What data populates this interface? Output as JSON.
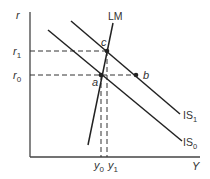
{
  "diagram": {
    "axes": {
      "y_label": "r",
      "x_label": "Y"
    },
    "y_ticks": [
      {
        "main": "r",
        "sub": "1"
      },
      {
        "main": "r",
        "sub": "0"
      }
    ],
    "x_ticks": [
      {
        "main": "y",
        "sub": "0"
      },
      {
        "main": "y",
        "sub": "1"
      }
    ],
    "curves": {
      "lm": {
        "label": "LM"
      },
      "is1": {
        "main": "IS",
        "sub": "1"
      },
      "is0": {
        "main": "IS",
        "sub": "0"
      }
    },
    "points": {
      "a": "a",
      "b": "b",
      "c": "c"
    },
    "colors": {
      "line": "#222222",
      "axis": "#444444",
      "dash": "#333333"
    }
  }
}
